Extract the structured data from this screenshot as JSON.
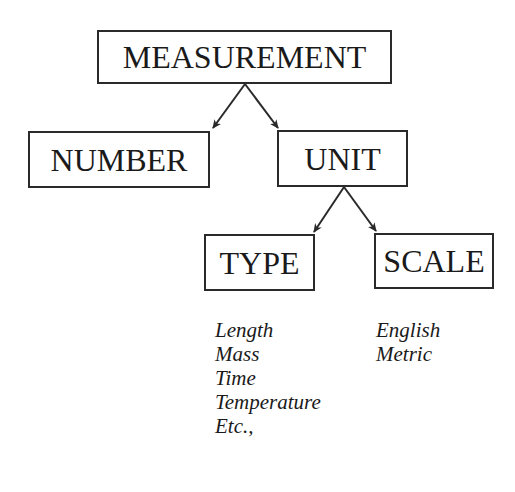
{
  "diagram": {
    "nodes": {
      "measurement": {
        "label": "MEASUREMENT"
      },
      "number": {
        "label": "NUMBER"
      },
      "unit": {
        "label": "UNIT"
      },
      "type": {
        "label": "TYPE"
      },
      "scale": {
        "label": "SCALE"
      }
    },
    "edges": [
      {
        "from": "MEASUREMENT",
        "to": "NUMBER"
      },
      {
        "from": "MEASUREMENT",
        "to": "UNIT"
      },
      {
        "from": "UNIT",
        "to": "TYPE"
      },
      {
        "from": "UNIT",
        "to": "SCALE"
      }
    ],
    "type_examples": [
      "Length",
      "Mass",
      "Time",
      "Temperature",
      "Etc.,"
    ],
    "scale_examples": [
      "English",
      "Metric"
    ]
  },
  "colors": {
    "stroke": "#2a2a2a",
    "text": "#1a1a1a",
    "background": "#ffffff"
  }
}
